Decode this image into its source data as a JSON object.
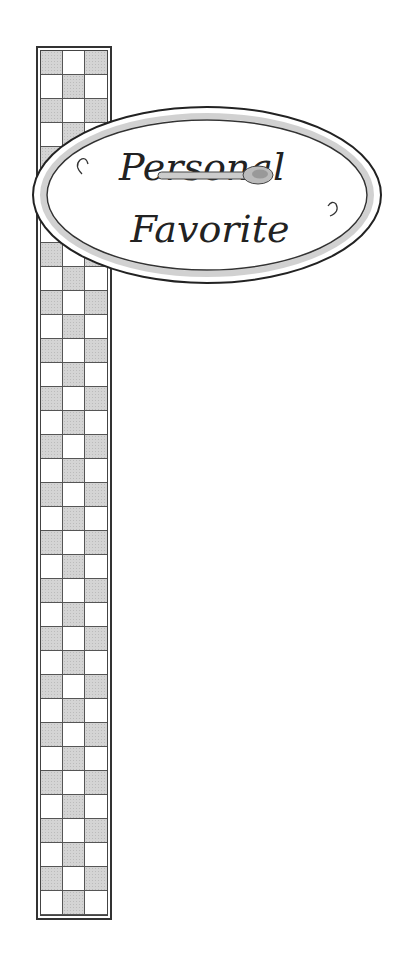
{
  "illustration": {
    "sign": {
      "line1": "Personal",
      "line2": "Favorite",
      "ornament": "spoon-icon"
    },
    "strip": {
      "columns": 3,
      "rows": 36,
      "pattern": "checkerboard"
    },
    "colors": {
      "outline": "#333333",
      "check_dark": "#d4d4d4",
      "background": "#ffffff"
    }
  }
}
